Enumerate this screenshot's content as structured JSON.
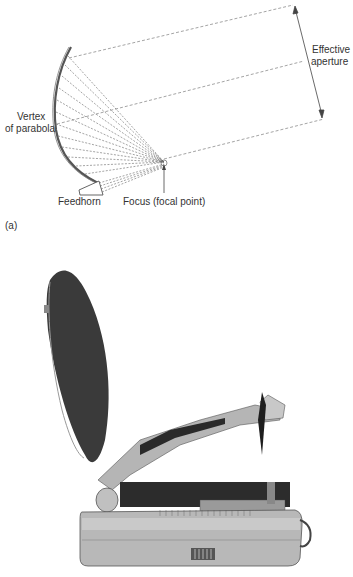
{
  "diagram": {
    "labels": {
      "effective_aperture_1": "Effective",
      "effective_aperture_2": "aperture",
      "vertex_1": "Vertex",
      "vertex_2": "of parabola",
      "feedhorn": "Feedhorn",
      "focus": "Focus (focal point)",
      "panel_a": "(a)"
    },
    "colors": {
      "line": "#555555",
      "dish_photo": "#3a3a3a",
      "body_photo": "#b8b8b8"
    }
  },
  "photo": {
    "subject": "portable-satellite-dish-terminal"
  }
}
